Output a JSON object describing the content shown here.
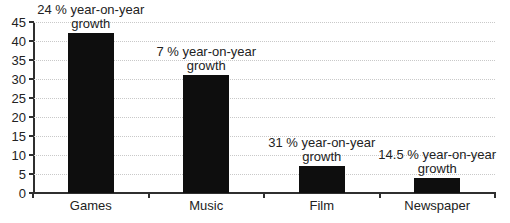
{
  "figure": {
    "background": "#ffffff"
  },
  "chart_data": {
    "type": "bar",
    "title": "",
    "xlabel": "",
    "ylabel": "",
    "categories": [
      "Games",
      "Music",
      "Film",
      "Newspaper"
    ],
    "values": [
      42,
      31,
      7,
      4
    ],
    "bar_annotations": [
      {
        "lines": [
          "24 % year-on-year",
          "growth"
        ]
      },
      {
        "lines": [
          "7 % year-on-year",
          "growth"
        ]
      },
      {
        "lines": [
          "31 % year-on-year",
          "growth"
        ]
      },
      {
        "lines": [
          "14.5 % year-on-year",
          "growth"
        ]
      }
    ],
    "ylim": [
      0,
      45
    ],
    "y_ticks": [
      0,
      5,
      10,
      15,
      20,
      25,
      30,
      35,
      40,
      45
    ],
    "grid": "horizontal-dotted",
    "legend": "none",
    "bar_color": "#0e0e0e",
    "gridline_color": "#c9c9c9",
    "axis_color": "#2f2f2f",
    "text_color": "#222222"
  }
}
